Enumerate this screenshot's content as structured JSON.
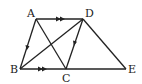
{
  "diagram": {
    "title": "",
    "points": [
      {
        "label": "A",
        "x": 36,
        "y": 19,
        "lx": 27,
        "ly": 17
      },
      {
        "label": "D",
        "x": 83,
        "y": 19,
        "lx": 86,
        "ly": 17
      },
      {
        "label": "B",
        "x": 20,
        "y": 69,
        "lx": 10,
        "ly": 73
      },
      {
        "label": "C",
        "x": 66,
        "y": 69,
        "lx": 62,
        "ly": 82
      },
      {
        "label": "E",
        "x": 126,
        "y": 69,
        "lx": 128,
        "ly": 73
      }
    ],
    "segments": [
      "AD",
      "AB",
      "AC",
      "BD",
      "DC",
      "DE",
      "BE"
    ],
    "parallel_marks": [
      "AD",
      "BC"
    ],
    "direction_arrows": [
      "AB",
      "DC"
    ],
    "colors": {
      "stroke": "#222222",
      "background": "#ffffff"
    }
  }
}
